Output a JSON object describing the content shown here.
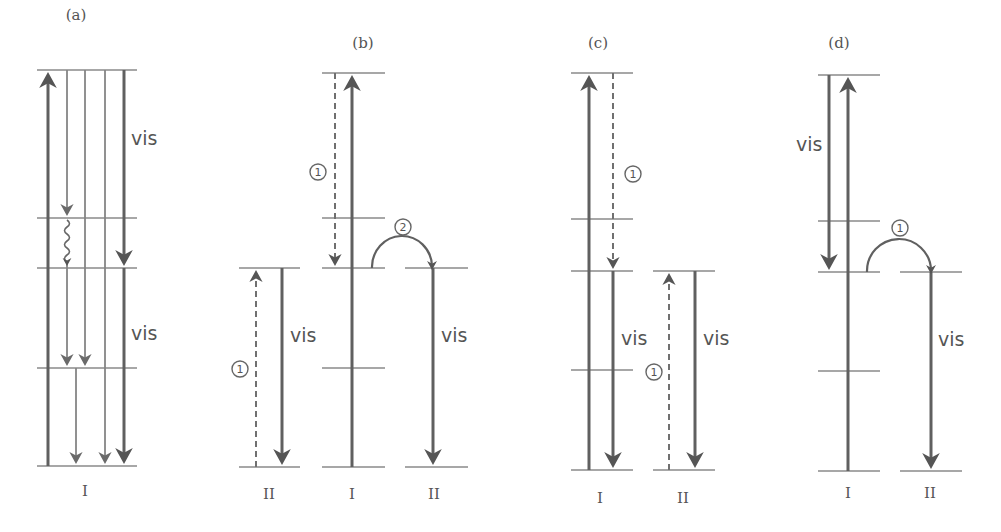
{
  "colors": {
    "line": "#606060",
    "level": "#8a8a8a",
    "text": "#555555",
    "background": "#ffffff"
  },
  "panels": [
    {
      "id": "a",
      "title": "(a)",
      "title_pos": [
        76,
        20
      ],
      "levels": [
        {
          "x1": 37,
          "x2": 137,
          "y": 70
        },
        {
          "x1": 37,
          "x2": 137,
          "y": 218
        },
        {
          "x1": 37,
          "x2": 137,
          "y": 268
        },
        {
          "x1": 37,
          "x2": 137,
          "y": 368
        },
        {
          "x1": 37,
          "x2": 137,
          "y": 466
        }
      ],
      "arrows": [
        {
          "x1": 48,
          "y1": 466,
          "x2": 48,
          "y2": 72,
          "style": "thick",
          "dir": "up"
        },
        {
          "x1": 67,
          "y1": 70,
          "x2": 67,
          "y2": 216,
          "style": "thin",
          "dir": "down"
        },
        {
          "x1": 67,
          "y1": 262,
          "x2": 67,
          "y2": 366,
          "style": "thin",
          "dir": "down"
        },
        {
          "x1": 85,
          "y1": 70,
          "x2": 85,
          "y2": 366,
          "style": "thin",
          "dir": "down"
        },
        {
          "x1": 76,
          "y1": 368,
          "x2": 76,
          "y2": 464,
          "style": "thin",
          "dir": "down"
        },
        {
          "x1": 105,
          "y1": 70,
          "x2": 105,
          "y2": 464,
          "style": "thin",
          "dir": "down"
        },
        {
          "x1": 124,
          "y1": 70,
          "x2": 124,
          "y2": 266,
          "style": "thick",
          "dir": "down"
        },
        {
          "x1": 124,
          "y1": 268,
          "x2": 124,
          "y2": 464,
          "style": "thick",
          "dir": "down"
        }
      ],
      "wavy": [
        {
          "x": 67,
          "y1": 220,
          "y2": 262
        }
      ],
      "texts": [
        {
          "kind": "vis",
          "text": "vis",
          "x": 131,
          "y": 145
        },
        {
          "kind": "vis",
          "text": "vis",
          "x": 131,
          "y": 340
        }
      ],
      "state_labels": [
        {
          "text": "I",
          "x": 85,
          "y": 496
        }
      ]
    },
    {
      "id": "b",
      "title": "(b)",
      "title_pos": [
        363,
        48
      ],
      "levels": [
        {
          "x1": 322,
          "x2": 385,
          "y": 73
        },
        {
          "x1": 322,
          "x2": 385,
          "y": 218
        },
        {
          "x1": 322,
          "x2": 385,
          "y": 268
        },
        {
          "x1": 322,
          "x2": 385,
          "y": 368
        },
        {
          "x1": 322,
          "x2": 385,
          "y": 467
        },
        {
          "x1": 239,
          "x2": 300,
          "y": 268
        },
        {
          "x1": 239,
          "x2": 300,
          "y": 467
        },
        {
          "x1": 405,
          "x2": 468,
          "y": 268
        },
        {
          "x1": 405,
          "x2": 468,
          "y": 467
        }
      ],
      "arrows": [
        {
          "x1": 352,
          "y1": 467,
          "x2": 352,
          "y2": 75,
          "style": "thick",
          "dir": "up"
        },
        {
          "x1": 335,
          "y1": 73,
          "x2": 335,
          "y2": 266,
          "style": "dash",
          "dir": "down"
        },
        {
          "x1": 256,
          "y1": 467,
          "x2": 256,
          "y2": 270,
          "style": "dash",
          "dir": "up"
        },
        {
          "x1": 282,
          "y1": 268,
          "x2": 282,
          "y2": 465,
          "style": "thick",
          "dir": "down"
        },
        {
          "x1": 433,
          "y1": 268,
          "x2": 433,
          "y2": 465,
          "style": "thick",
          "dir": "down"
        }
      ],
      "arcs": [
        {
          "x1": 372,
          "x2": 432,
          "y": 268,
          "r": 31
        }
      ],
      "circles": [
        {
          "text": "1",
          "x": 318,
          "y": 172
        },
        {
          "text": "2",
          "x": 403,
          "y": 227
        },
        {
          "text": "1",
          "x": 240,
          "y": 369
        }
      ],
      "texts": [
        {
          "kind": "vis",
          "text": "vis",
          "x": 290,
          "y": 342
        },
        {
          "kind": "vis",
          "text": "vis",
          "x": 441,
          "y": 342
        }
      ],
      "state_labels": [
        {
          "text": "II",
          "x": 269,
          "y": 499
        },
        {
          "text": "I",
          "x": 352,
          "y": 499
        },
        {
          "text": "II",
          "x": 434,
          "y": 499
        }
      ]
    },
    {
      "id": "c",
      "title": "(c)",
      "title_pos": [
        598,
        48
      ],
      "levels": [
        {
          "x1": 571,
          "x2": 633,
          "y": 73
        },
        {
          "x1": 571,
          "x2": 633,
          "y": 219
        },
        {
          "x1": 571,
          "x2": 633,
          "y": 271
        },
        {
          "x1": 571,
          "x2": 633,
          "y": 370
        },
        {
          "x1": 571,
          "x2": 633,
          "y": 470
        },
        {
          "x1": 653,
          "x2": 715,
          "y": 271
        },
        {
          "x1": 653,
          "x2": 715,
          "y": 470
        }
      ],
      "arrows": [
        {
          "x1": 589,
          "y1": 470,
          "x2": 589,
          "y2": 75,
          "style": "thick",
          "dir": "up"
        },
        {
          "x1": 613,
          "y1": 73,
          "x2": 613,
          "y2": 269,
          "style": "dash",
          "dir": "down"
        },
        {
          "x1": 613,
          "y1": 271,
          "x2": 613,
          "y2": 468,
          "style": "thick",
          "dir": "down"
        },
        {
          "x1": 669,
          "y1": 470,
          "x2": 669,
          "y2": 273,
          "style": "dash",
          "dir": "up"
        },
        {
          "x1": 695,
          "y1": 271,
          "x2": 695,
          "y2": 468,
          "style": "thick",
          "dir": "down"
        }
      ],
      "circles": [
        {
          "text": "1",
          "x": 633,
          "y": 174
        },
        {
          "text": "1",
          "x": 654,
          "y": 372
        }
      ],
      "texts": [
        {
          "kind": "vis",
          "text": "vis",
          "x": 621,
          "y": 345
        },
        {
          "kind": "vis",
          "text": "vis",
          "x": 703,
          "y": 345
        }
      ],
      "state_labels": [
        {
          "text": "I",
          "x": 600,
          "y": 503
        },
        {
          "text": "II",
          "x": 683,
          "y": 503
        }
      ]
    },
    {
      "id": "d",
      "title": "(d)",
      "title_pos": [
        839,
        48
      ],
      "levels": [
        {
          "x1": 818,
          "x2": 880,
          "y": 75
        },
        {
          "x1": 818,
          "x2": 880,
          "y": 221
        },
        {
          "x1": 818,
          "x2": 880,
          "y": 272
        },
        {
          "x1": 818,
          "x2": 880,
          "y": 371
        },
        {
          "x1": 818,
          "x2": 880,
          "y": 471
        },
        {
          "x1": 900,
          "x2": 962,
          "y": 272
        },
        {
          "x1": 900,
          "x2": 962,
          "y": 471
        }
      ],
      "arrows": [
        {
          "x1": 829,
          "y1": 75,
          "x2": 829,
          "y2": 270,
          "style": "thick",
          "dir": "down"
        },
        {
          "x1": 848,
          "y1": 471,
          "x2": 848,
          "y2": 77,
          "style": "thick",
          "dir": "up"
        },
        {
          "x1": 931,
          "y1": 272,
          "x2": 931,
          "y2": 469,
          "style": "thick",
          "dir": "down"
        }
      ],
      "arcs": [
        {
          "x1": 867,
          "x2": 931,
          "y": 272,
          "r": 32
        }
      ],
      "circles": [
        {
          "text": "1",
          "x": 900,
          "y": 228
        }
      ],
      "texts": [
        {
          "kind": "vis",
          "text": "vis",
          "x": 796,
          "y": 151
        },
        {
          "kind": "vis",
          "text": "vis",
          "x": 938,
          "y": 346
        }
      ],
      "state_labels": [
        {
          "text": "I",
          "x": 848,
          "y": 498
        },
        {
          "text": "II",
          "x": 930,
          "y": 498
        }
      ]
    }
  ]
}
